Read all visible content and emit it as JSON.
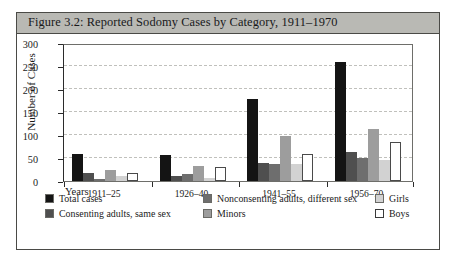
{
  "figure": {
    "title": "Figure 3.2: Reported Sodomy Cases by Category, 1911–1970"
  },
  "chart_data": {
    "type": "bar",
    "title": "Figure 3.2: Reported Sodomy Cases by Category, 1911–1970",
    "xlabel": "Years",
    "ylabel": "Number of Cases",
    "categories": [
      "1911–25",
      "1926–40",
      "1941–55",
      "1956–70"
    ],
    "ylim": [
      0,
      300
    ],
    "yticks": [
      0,
      50,
      100,
      150,
      200,
      250,
      300
    ],
    "grid": true,
    "legend_position": "below",
    "series": [
      {
        "name": "Total cases",
        "color": "#141414",
        "values": [
          58,
          56,
          178,
          258
        ]
      },
      {
        "name": "Consenting adults, same sex",
        "color": "#4f4f4f",
        "values": [
          18,
          11,
          39,
          63
        ]
      },
      {
        "name": "Nonconsenting adults, different sex",
        "color": "#6e6e6e",
        "values": [
          3,
          15,
          36,
          50
        ]
      },
      {
        "name": "Minors",
        "color": "#9d9d9d",
        "values": [
          23,
          33,
          98,
          113
        ]
      },
      {
        "name": "Girls",
        "color": "#d2d2d2",
        "values": [
          10,
          6,
          38,
          45
        ]
      },
      {
        "name": "Boys",
        "color": "#ffffff",
        "values": [
          17,
          30,
          58,
          85
        ]
      }
    ]
  },
  "axis": {
    "years_label": "Years"
  }
}
